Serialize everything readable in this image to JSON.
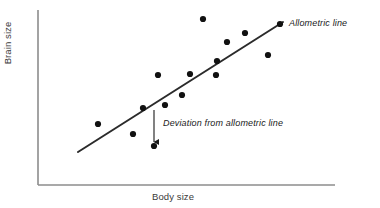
{
  "figure": {
    "type": "scatter-with-trendline",
    "background_color": "#ffffff"
  },
  "axes": {
    "x_label": "Body size",
    "y_label": "Brain size",
    "axis_color": "#8c8c8c",
    "x_axis": {
      "x_start": 38,
      "x_end": 335,
      "y": 185
    },
    "y_axis": {
      "x": 38,
      "y_start": 10,
      "y_end": 185
    },
    "ticks": [],
    "grid": false
  },
  "annotations": [
    {
      "id": "allometric-line-label",
      "text": "Allometric line",
      "style": "italic",
      "color": "#1a1a1a",
      "x": 289,
      "y": 18
    },
    {
      "id": "deviation-label",
      "text": "Deviation from allometric line",
      "style": "italic",
      "color": "#1a1a1a",
      "x": 163,
      "y": 118
    }
  ],
  "chart_data": {
    "type": "scatter",
    "title": "",
    "xlabel": "Body size",
    "ylabel": "Brain size",
    "xlim": [
      38,
      335
    ],
    "ylim": [
      10,
      185
    ],
    "grid": false,
    "legend": null,
    "point_color": "#111111",
    "point_radius": 3.1,
    "points": [
      {
        "x": 98,
        "y": 124
      },
      {
        "x": 133,
        "y": 134
      },
      {
        "x": 143,
        "y": 108
      },
      {
        "x": 154,
        "y": 146
      },
      {
        "x": 158,
        "y": 75
      },
      {
        "x": 165,
        "y": 105
      },
      {
        "x": 182,
        "y": 95
      },
      {
        "x": 190,
        "y": 74
      },
      {
        "x": 203,
        "y": 19
      },
      {
        "x": 216,
        "y": 75
      },
      {
        "x": 217,
        "y": 61
      },
      {
        "x": 227,
        "y": 42
      },
      {
        "x": 245,
        "y": 33
      },
      {
        "x": 268,
        "y": 55
      },
      {
        "x": 280,
        "y": 24
      }
    ],
    "trendline": {
      "name": "Allometric line",
      "color": "#2b2b2b",
      "width": 2,
      "x1": 78,
      "y1": 152,
      "x2": 283,
      "y2": 22
    },
    "deviation_arrow": {
      "label": "Deviation from allometric line",
      "color": "#1a1a1a",
      "x": 154,
      "y_from": 110,
      "y_to": 142
    }
  }
}
